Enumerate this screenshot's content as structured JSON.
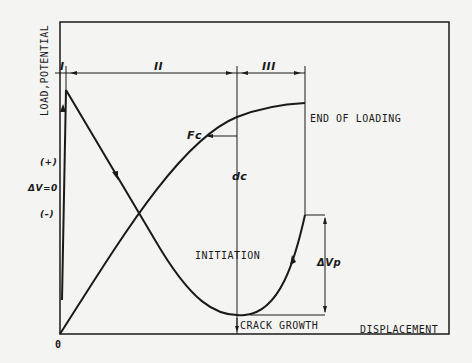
{
  "axes": {
    "y_label": "LOAD,POTENTIAL",
    "x_label": "DISPLACEMENT",
    "origin": "0"
  },
  "regions": [
    {
      "label": "I"
    },
    {
      "label": "II"
    },
    {
      "label": "III"
    }
  ],
  "potential_marks": {
    "plus": "(+)",
    "zero": "ΔV=0",
    "minus": "(–)"
  },
  "annotations": {
    "end_of_loading": "END OF LOADING",
    "fc": "Fc",
    "dc": "dc",
    "initiation": "INITIATION",
    "delta_vp": "ΔVp",
    "crack_growth": "CRACK GROWTH"
  },
  "colors": {
    "ink": "#1a1a1a",
    "paper": "#f4f4f2"
  }
}
